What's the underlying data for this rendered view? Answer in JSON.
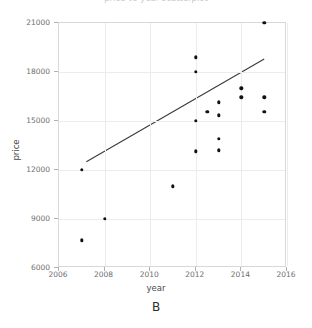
{
  "figure": {
    "clipped_title": "price vs year scatterplot",
    "panel_label": "B"
  },
  "axes": {
    "x_title": "year",
    "y_title": "price",
    "x_ticks": [
      "2006",
      "2008",
      "2010",
      "2012",
      "2014",
      "2016"
    ],
    "y_ticks": [
      "6000",
      "9000",
      "12000",
      "15000",
      "18000",
      "21000"
    ]
  },
  "chart_data": {
    "type": "scatter",
    "title": "",
    "xlabel": "year",
    "ylabel": "price",
    "xlim": [
      2006,
      2016
    ],
    "ylim": [
      6000,
      21000
    ],
    "xticks": [
      2006,
      2008,
      2010,
      2012,
      2014,
      2016
    ],
    "yticks": [
      6000,
      9000,
      12000,
      15000,
      18000,
      21000
    ],
    "grid": true,
    "legend": "none",
    "panel_label": "B",
    "points": [
      {
        "x": 2007.0,
        "y": 12000
      },
      {
        "x": 2007.0,
        "y": 7700
      },
      {
        "x": 2008.0,
        "y": 9000
      },
      {
        "x": 2011.0,
        "y": 11000
      },
      {
        "x": 2012.0,
        "y": 18900
      },
      {
        "x": 2012.0,
        "y": 18000
      },
      {
        "x": 2012.0,
        "y": 15000
      },
      {
        "x": 2012.0,
        "y": 13150
      },
      {
        "x": 2012.5,
        "y": 15550
      },
      {
        "x": 2013.0,
        "y": 16150
      },
      {
        "x": 2013.0,
        "y": 15350
      },
      {
        "x": 2013.0,
        "y": 13900
      },
      {
        "x": 2013.0,
        "y": 13200
      },
      {
        "x": 2014.0,
        "y": 17000
      },
      {
        "x": 2014.0,
        "y": 16450
      },
      {
        "x": 2015.0,
        "y": 21000
      },
      {
        "x": 2015.0,
        "y": 16450
      },
      {
        "x": 2015.0,
        "y": 15550
      }
    ],
    "fit_line": {
      "type": "linear-regression",
      "x_start": 2007.2,
      "y_start": 12500,
      "x_end": 2015.0,
      "y_end": 18800
    }
  }
}
